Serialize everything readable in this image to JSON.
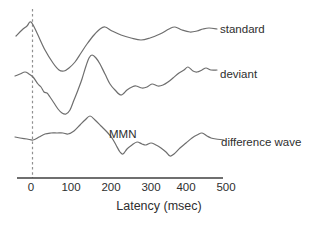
{
  "figure": {
    "background_color": "#ffffff",
    "trace_color": "#6e6e6e",
    "axis_color": "#3f3f3f",
    "zero_line_color": "#909090",
    "text_color": "#2e2e2e"
  },
  "chart_data": {
    "type": "line",
    "title": "",
    "xlabel": "Latency (msec)",
    "ylabel": "",
    "x_axis": {
      "ticks": [
        "0",
        "100",
        "200",
        "300",
        "400",
        "500"
      ],
      "tick_px": [
        31,
        71,
        111,
        151,
        186,
        226
      ],
      "axis_y_px": 178,
      "axis_x1_px": 17,
      "axis_x2_px": 223,
      "zero_line_x_px": 32.5,
      "zero_line_top_px": 9,
      "px_per_100_msec": 39.5,
      "range_msec": [
        -40,
        480
      ]
    },
    "note": "Event-related potential waveforms; amplitude axis unlabeled (arbitrary units). Series points are [x_px,y_px] in the 313x226 image; latency_msec = (x_px - 31) * 100 / 39.5.",
    "series": [
      {
        "name": "standard",
        "label": "standard",
        "label_pos_px": [
          220,
          23.5
        ],
        "points": [
          [
            16,
            36
          ],
          [
            22,
            30
          ],
          [
            27,
            26
          ],
          [
            31,
            22
          ],
          [
            37,
            33
          ],
          [
            45,
            50
          ],
          [
            53,
            63
          ],
          [
            59,
            70
          ],
          [
            64,
            71
          ],
          [
            69,
            68
          ],
          [
            75,
            62
          ],
          [
            81,
            53
          ],
          [
            87,
            44
          ],
          [
            94,
            35
          ],
          [
            100,
            29
          ],
          [
            105,
            27
          ],
          [
            112,
            31
          ],
          [
            121,
            35
          ],
          [
            131,
            38
          ],
          [
            141,
            40
          ],
          [
            150,
            38
          ],
          [
            160,
            34
          ],
          [
            169,
            29
          ],
          [
            175,
            27
          ],
          [
            182,
            30
          ],
          [
            190,
            32
          ],
          [
            197,
            31
          ],
          [
            203,
            29
          ],
          [
            209,
            28
          ],
          [
            217,
            29
          ]
        ]
      },
      {
        "name": "deviant",
        "label": "deviant",
        "label_pos_px": [
          220,
          69
        ],
        "points": [
          [
            15,
            76
          ],
          [
            20,
            74
          ],
          [
            25,
            72
          ],
          [
            29,
            74
          ],
          [
            33,
            77
          ],
          [
            38,
            84
          ],
          [
            41,
            87
          ],
          [
            44,
            92
          ],
          [
            47,
            93
          ],
          [
            50,
            97
          ],
          [
            54,
            103
          ],
          [
            58,
            109
          ],
          [
            62,
            113
          ],
          [
            66,
            114
          ],
          [
            70,
            110
          ],
          [
            74,
            100
          ],
          [
            78,
            90
          ],
          [
            82,
            79
          ],
          [
            86,
            66
          ],
          [
            89,
            58
          ],
          [
            92,
            55
          ],
          [
            96,
            58
          ],
          [
            100,
            64
          ],
          [
            105,
            74
          ],
          [
            110,
            84
          ],
          [
            115,
            90
          ],
          [
            121,
            95
          ],
          [
            127,
            90
          ],
          [
            132,
            87
          ],
          [
            136,
            86
          ],
          [
            142,
            88
          ],
          [
            147,
            87
          ],
          [
            152,
            84
          ],
          [
            158,
            86
          ],
          [
            163,
            85
          ],
          [
            168,
            82
          ],
          [
            173,
            78
          ],
          [
            179,
            73
          ],
          [
            184,
            70
          ],
          [
            188,
            67
          ],
          [
            193,
            71
          ],
          [
            197,
            72
          ],
          [
            202,
            70
          ],
          [
            206,
            68
          ],
          [
            211,
            70
          ],
          [
            217,
            70
          ]
        ]
      },
      {
        "name": "difference-wave",
        "label": "difference wave",
        "label_pos_px": [
          221,
          136.5
        ],
        "points": [
          [
            15,
            137
          ],
          [
            20,
            138
          ],
          [
            27,
            139
          ],
          [
            33,
            140
          ],
          [
            39,
            137
          ],
          [
            45,
            134
          ],
          [
            51,
            133
          ],
          [
            57,
            133
          ],
          [
            63,
            133
          ],
          [
            68,
            134
          ],
          [
            74,
            131
          ],
          [
            80,
            125
          ],
          [
            85,
            120
          ],
          [
            90,
            116
          ],
          [
            95,
            120
          ],
          [
            101,
            126
          ],
          [
            107,
            132
          ],
          [
            112,
            138
          ],
          [
            116,
            145
          ],
          [
            120,
            152
          ],
          [
            123,
            154
          ],
          [
            127,
            149
          ],
          [
            132,
            145
          ],
          [
            137,
            142
          ],
          [
            142,
            144
          ],
          [
            146,
            145
          ],
          [
            151,
            143
          ],
          [
            156,
            145
          ],
          [
            161,
            148
          ],
          [
            166,
            152
          ],
          [
            170,
            156
          ],
          [
            174,
            154
          ],
          [
            180,
            148
          ],
          [
            186,
            143
          ],
          [
            192,
            138
          ],
          [
            197,
            135
          ],
          [
            202,
            133
          ],
          [
            207,
            136
          ],
          [
            211,
            138
          ],
          [
            216,
            139
          ],
          [
            224,
            140
          ]
        ]
      }
    ],
    "annotations": [
      {
        "text": "MMN",
        "pos_px": [
          109,
          128.5
        ]
      }
    ],
    "legend_position": "right-of-traces",
    "grid": false
  }
}
